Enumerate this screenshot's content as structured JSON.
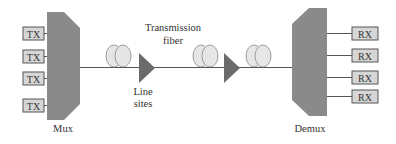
{
  "diagram": {
    "colors": {
      "mux_fill": "#8a8a8a",
      "amp_fill": "#6b6b6b",
      "box_fill": "#d6d6d6",
      "box_stroke": "#555555",
      "line": "#555555",
      "coil_fill": "#e6e6e6",
      "coil_stroke": "#888888",
      "text": "#333333"
    },
    "transmitters": [
      {
        "label": "TX"
      },
      {
        "label": "TX"
      },
      {
        "label": "TX"
      },
      {
        "label": "TX"
      }
    ],
    "receivers": [
      {
        "label": "RX"
      },
      {
        "label": "RX"
      },
      {
        "label": "RX"
      },
      {
        "label": "RX"
      }
    ],
    "mux": {
      "label": "Mux"
    },
    "demux": {
      "label": "Demux"
    },
    "fiber_label": {
      "line1": "Transmission",
      "line2": "fiber"
    },
    "line_sites_label": {
      "line1": "Line",
      "line2": "sites"
    },
    "fiber_spans": 3,
    "amplifiers": 2
  }
}
